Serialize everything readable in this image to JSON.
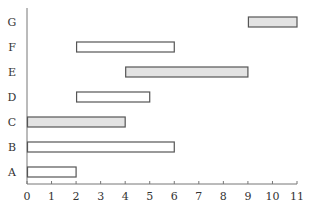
{
  "chart_data": {
    "type": "gantt",
    "title": "",
    "xlabel": "",
    "ylabel": "",
    "xlim": [
      0,
      11
    ],
    "x_ticks": [
      "0",
      "1",
      "2",
      "3",
      "4",
      "5",
      "6",
      "7",
      "8",
      "9",
      "10",
      "11"
    ],
    "categories": [
      "A",
      "B",
      "C",
      "D",
      "E",
      "F",
      "G"
    ],
    "grid": false,
    "legend": null,
    "bars": [
      {
        "label": "A",
        "start": 0,
        "end": 2,
        "fill": "white"
      },
      {
        "label": "B",
        "start": 0,
        "end": 6,
        "fill": "white"
      },
      {
        "label": "C",
        "start": 0,
        "end": 4,
        "fill": "gray"
      },
      {
        "label": "D",
        "start": 2,
        "end": 5,
        "fill": "white"
      },
      {
        "label": "E",
        "start": 4,
        "end": 9,
        "fill": "gray"
      },
      {
        "label": "F",
        "start": 2,
        "end": 6,
        "fill": "white"
      },
      {
        "label": "G",
        "start": 9,
        "end": 11,
        "fill": "gray"
      }
    ]
  },
  "colors": {
    "gray_fill": "#e3e3e3",
    "white_fill": "#ffffff",
    "stroke": "#555555",
    "axis": "#777777"
  }
}
